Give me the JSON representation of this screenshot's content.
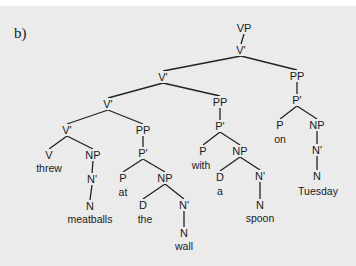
{
  "figure": {
    "label": "b)",
    "background": "#ebebeb",
    "ink": "#1a1a1a"
  },
  "tree": {
    "nodes": [
      {
        "id": "vp",
        "label": "VP",
        "x": 244,
        "y": 28
      },
      {
        "id": "v1",
        "label": "V'",
        "x": 241,
        "y": 50
      },
      {
        "id": "v2",
        "label": "V'",
        "x": 163,
        "y": 77
      },
      {
        "id": "pp3",
        "label": "PP",
        "x": 297,
        "y": 76
      },
      {
        "id": "v3",
        "label": "V'",
        "x": 108,
        "y": 104
      },
      {
        "id": "pp2",
        "label": "PP",
        "x": 220,
        "y": 102
      },
      {
        "id": "p3b",
        "label": "P'",
        "x": 297,
        "y": 100
      },
      {
        "id": "v4",
        "label": "V'",
        "x": 67,
        "y": 130
      },
      {
        "id": "pp1",
        "label": "PP",
        "x": 143,
        "y": 130
      },
      {
        "id": "p2b",
        "label": "P'",
        "x": 220,
        "y": 126
      },
      {
        "id": "p3",
        "label": "P",
        "x": 280,
        "y": 125
      },
      {
        "id": "np3",
        "label": "NP",
        "x": 317,
        "y": 125
      },
      {
        "id": "v",
        "label": "V",
        "x": 49,
        "y": 155
      },
      {
        "id": "np0",
        "label": "NP",
        "x": 93,
        "y": 155
      },
      {
        "id": "p1b",
        "label": "P'",
        "x": 143,
        "y": 153
      },
      {
        "id": "p2",
        "label": "P",
        "x": 203,
        "y": 151
      },
      {
        "id": "np2",
        "label": "NP",
        "x": 240,
        "y": 151
      },
      {
        "id": "n3b",
        "label": "N'",
        "x": 317,
        "y": 150
      },
      {
        "id": "n0b",
        "label": "N'",
        "x": 92,
        "y": 179
      },
      {
        "id": "p1",
        "label": "P",
        "x": 123,
        "y": 178
      },
      {
        "id": "np1",
        "label": "NP",
        "x": 165,
        "y": 178
      },
      {
        "id": "d2",
        "label": "D",
        "x": 220,
        "y": 177
      },
      {
        "id": "n2b",
        "label": "N'",
        "x": 260,
        "y": 176
      },
      {
        "id": "n3",
        "label": "N",
        "x": 317,
        "y": 176
      },
      {
        "id": "d1",
        "label": "D",
        "x": 143,
        "y": 205
      },
      {
        "id": "n1b",
        "label": "N'",
        "x": 184,
        "y": 205
      },
      {
        "id": "n0",
        "label": "N",
        "x": 90,
        "y": 206
      },
      {
        "id": "n2",
        "label": "N",
        "x": 260,
        "y": 205
      },
      {
        "id": "n1",
        "label": "N",
        "x": 184,
        "y": 233
      }
    ],
    "words": [
      {
        "id": "w-threw",
        "text": "threw",
        "x": 49,
        "y": 168
      },
      {
        "id": "w-meatballs",
        "text": "meatballs",
        "x": 90,
        "y": 219
      },
      {
        "id": "w-at",
        "text": "at",
        "x": 123,
        "y": 192
      },
      {
        "id": "w-the",
        "text": "the",
        "x": 145,
        "y": 219
      },
      {
        "id": "w-wall",
        "text": "wall",
        "x": 184,
        "y": 246
      },
      {
        "id": "w-with",
        "text": "with",
        "x": 201,
        "y": 165
      },
      {
        "id": "w-a",
        "text": "a",
        "x": 220,
        "y": 191
      },
      {
        "id": "w-spoon",
        "text": "spoon",
        "x": 260,
        "y": 218
      },
      {
        "id": "w-on",
        "text": "on",
        "x": 280,
        "y": 139
      },
      {
        "id": "w-tuesday",
        "text": "Tuesday",
        "x": 318,
        "y": 191
      }
    ],
    "edges": [
      [
        "vp",
        "v1"
      ],
      [
        "v1",
        "v2"
      ],
      [
        "v1",
        "pp3"
      ],
      [
        "v2",
        "v3"
      ],
      [
        "v2",
        "pp2"
      ],
      [
        "pp3",
        "p3b"
      ],
      [
        "v3",
        "v4"
      ],
      [
        "v3",
        "pp1"
      ],
      [
        "pp2",
        "p2b"
      ],
      [
        "p3b",
        "p3"
      ],
      [
        "p3b",
        "np3"
      ],
      [
        "v4",
        "v"
      ],
      [
        "v4",
        "np0"
      ],
      [
        "pp1",
        "p1b"
      ],
      [
        "p2b",
        "p2"
      ],
      [
        "p2b",
        "np2"
      ],
      [
        "np3",
        "n3b"
      ],
      [
        "np0",
        "n0b"
      ],
      [
        "p1b",
        "p1"
      ],
      [
        "p1b",
        "np1"
      ],
      [
        "np2",
        "d2"
      ],
      [
        "np2",
        "n2b"
      ],
      [
        "n3b",
        "n3"
      ],
      [
        "n0b",
        "n0"
      ],
      [
        "np1",
        "d1"
      ],
      [
        "np1",
        "n1b"
      ],
      [
        "n2b",
        "n2"
      ],
      [
        "n1b",
        "n1"
      ]
    ]
  }
}
